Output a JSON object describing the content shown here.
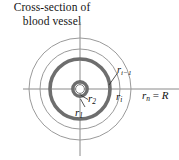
{
  "figure": {
    "caption": "Cross-section of\nblood vessel",
    "background": "#ffffff",
    "width": 179,
    "height": 160
  },
  "diagram": {
    "center": {
      "x": 80,
      "y": 89
    },
    "colors": {
      "thick_ring": "#6e6e6e",
      "thin_circle": "#9a9a9a",
      "axis": "#8a8a8a",
      "leader": "#2b2b2b",
      "text": "#111111"
    },
    "circles": [
      {
        "name": "inner-core-circle",
        "radius": 5,
        "stroke": "#6e6e6e",
        "stroke_width": 1.2
      },
      {
        "name": "inner-thick-ring",
        "radius": 7.2,
        "stroke": "#6e6e6e",
        "stroke_width": 3.4
      },
      {
        "name": "main-thick-ring",
        "radius": 30,
        "stroke": "#6e6e6e",
        "stroke_width": 3.6
      },
      {
        "name": "intermediate-thin-circle",
        "radius": 40,
        "stroke": "#9a9a9a",
        "stroke_width": 1
      },
      {
        "name": "outer-thin-circle",
        "radius": 51,
        "stroke": "#9a9a9a",
        "stroke_width": 1
      }
    ],
    "axes": {
      "horizontal": {
        "x1": 23,
        "y1": 89,
        "x2": 179,
        "y2": 89
      },
      "vertical": {
        "x1": 80,
        "y1": 22,
        "x2": 80,
        "y2": 156
      }
    },
    "leaders": [
      {
        "name": "leader-r1",
        "x1": 80,
        "y1": 100,
        "x2": 86,
        "y2": 108
      },
      {
        "name": "leader-r2",
        "x1": 80,
        "y1": 95,
        "x2": 89,
        "y2": 100
      },
      {
        "name": "leader-ri-minus-1",
        "x1": 109,
        "y1": 86,
        "x2": 118,
        "y2": 74
      }
    ]
  },
  "labels": {
    "r1": {
      "base": "r",
      "sub": "1"
    },
    "r2": {
      "base": "r",
      "sub": "2"
    },
    "ri_minus_1": {
      "base": "r",
      "sub": "i−1"
    },
    "ri": {
      "base": "r",
      "sub": "i"
    },
    "rn": {
      "base": "r",
      "sub": "n",
      "equals": " = ",
      "value": "R"
    }
  }
}
